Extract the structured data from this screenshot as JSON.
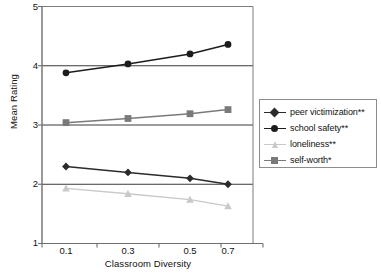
{
  "chart_data": {
    "type": "line",
    "title": "",
    "xlabel": "Classroom Diversity",
    "ylabel": "Mean Rating",
    "categories": [
      "0.1",
      "0.3",
      "0.5",
      "0.7"
    ],
    "x": [
      0.1,
      0.3,
      0.5,
      0.7
    ],
    "ylim": [
      1,
      5
    ],
    "xlim": [
      0,
      0.8
    ],
    "yticks": [
      1,
      2,
      3,
      4,
      5
    ],
    "grid": "horizontal gridlines at 2, 3, 4",
    "legend_position": "right-outside",
    "series": [
      {
        "name": "peer victimization**",
        "values": [
          2.3,
          2.2,
          2.1,
          2.0
        ],
        "marker": "diamond",
        "color": "#2b2b2b"
      },
      {
        "name": "school safety**",
        "values": [
          3.88,
          4.03,
          4.2,
          4.36
        ],
        "marker": "circle",
        "color": "#1c1c1c"
      },
      {
        "name": "loneliness**",
        "values": [
          1.93,
          1.84,
          1.74,
          1.63
        ],
        "marker": "triangle",
        "color": "#c9c9c9"
      },
      {
        "name": "self-worth*",
        "values": [
          3.04,
          3.11,
          3.19,
          3.26
        ],
        "marker": "square",
        "color": "#7a7a7a"
      }
    ]
  },
  "axes": {
    "y_tick_labels": [
      "5",
      "4",
      "3",
      "2",
      "1"
    ],
    "x_tick_labels": [
      "0.1",
      "0.3",
      "0.5",
      "0.7"
    ],
    "y_axis_title": "Mean Rating",
    "x_axis_title": "Classroom Diversity"
  },
  "legend": {
    "items": [
      {
        "label": "peer victimization**",
        "marker": "diamond-marker",
        "color": "#2b2b2b"
      },
      {
        "label": "school safety**",
        "marker": "circle-marker",
        "color": "#1c1c1c"
      },
      {
        "label": "loneliness**",
        "marker": "triangle-marker",
        "color": "#c9c9c9"
      },
      {
        "label": "self-worth*",
        "marker": "square-marker",
        "color": "#7a7a7a"
      }
    ]
  },
  "colors": {
    "axis": "#6f6f6f",
    "gridline": "#3a3a3a",
    "frame": "#7d7d7d",
    "background": "#ffffff"
  }
}
